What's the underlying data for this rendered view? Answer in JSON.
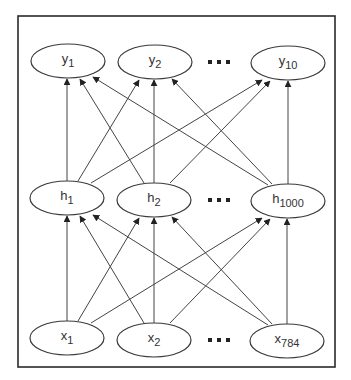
{
  "diagram": {
    "title": "",
    "layers": [
      {
        "name": "output",
        "nodes": [
          {
            "id": "y1",
            "base": "y",
            "sub": "1",
            "cx": 68,
            "cy": 61
          },
          {
            "id": "y2",
            "base": "y",
            "sub": "2",
            "cx": 155,
            "cy": 62
          },
          {
            "id": "y10",
            "base": "y",
            "sub": "10",
            "cx": 288,
            "cy": 63
          }
        ],
        "ellipsis": {
          "text": "• • •",
          "x": 219,
          "y": 62
        }
      },
      {
        "name": "hidden",
        "nodes": [
          {
            "id": "h1",
            "base": "h",
            "sub": "1",
            "cx": 67,
            "cy": 198
          },
          {
            "id": "h2",
            "base": "h",
            "sub": "2",
            "cx": 154,
            "cy": 200
          },
          {
            "id": "h1000",
            "base": "h",
            "sub": "1000",
            "cx": 288,
            "cy": 201
          }
        ],
        "ellipsis": {
          "text": "• • •",
          "x": 219,
          "y": 200
        }
      },
      {
        "name": "input",
        "nodes": [
          {
            "id": "x1",
            "base": "x",
            "sub": "1",
            "cx": 67,
            "cy": 338
          },
          {
            "id": "x2",
            "base": "x",
            "sub": "2",
            "cx": 154,
            "cy": 340
          },
          {
            "id": "x784",
            "base": "x",
            "sub": "784",
            "cx": 287,
            "cy": 341
          }
        ],
        "ellipsis": {
          "text": "• • •",
          "x": 219,
          "y": 340
        }
      }
    ],
    "node_rx": 37,
    "node_ry": 17,
    "edges": [
      {
        "from": "h1",
        "to": "y1",
        "x1": 67,
        "y1": 181,
        "x2": 67,
        "y2": 79
      },
      {
        "from": "h1",
        "to": "y2",
        "x1": 78,
        "y1": 181,
        "x2": 139,
        "y2": 80
      },
      {
        "from": "h1",
        "to": "y10",
        "x1": 91,
        "y1": 183,
        "x2": 262,
        "y2": 80
      },
      {
        "from": "h2",
        "to": "y1",
        "x1": 144,
        "y1": 183,
        "x2": 80,
        "y2": 79
      },
      {
        "from": "h2",
        "to": "y2",
        "x1": 154,
        "y1": 183,
        "x2": 154,
        "y2": 80
      },
      {
        "from": "h2",
        "to": "y10",
        "x1": 170,
        "y1": 183,
        "x2": 270,
        "y2": 81
      },
      {
        "from": "h1000",
        "to": "y1",
        "x1": 268,
        "y1": 185,
        "x2": 93,
        "y2": 77
      },
      {
        "from": "h1000",
        "to": "y2",
        "x1": 272,
        "y1": 184,
        "x2": 172,
        "y2": 79
      },
      {
        "from": "h1000",
        "to": "y10",
        "x1": 288,
        "y1": 184,
        "x2": 288,
        "y2": 81
      },
      {
        "from": "x1",
        "to": "h1",
        "x1": 67,
        "y1": 321,
        "x2": 67,
        "y2": 216
      },
      {
        "from": "x1",
        "to": "h2",
        "x1": 78,
        "y1": 321,
        "x2": 139,
        "y2": 218
      },
      {
        "from": "x1",
        "to": "h1000",
        "x1": 91,
        "y1": 323,
        "x2": 262,
        "y2": 218
      },
      {
        "from": "x2",
        "to": "h1",
        "x1": 144,
        "y1": 323,
        "x2": 80,
        "y2": 216
      },
      {
        "from": "x2",
        "to": "h2",
        "x1": 154,
        "y1": 323,
        "x2": 154,
        "y2": 218
      },
      {
        "from": "x2",
        "to": "h1000",
        "x1": 170,
        "y1": 323,
        "x2": 270,
        "y2": 219
      },
      {
        "from": "x784",
        "to": "h1",
        "x1": 268,
        "y1": 325,
        "x2": 93,
        "y2": 215
      },
      {
        "from": "x784",
        "to": "h2",
        "x1": 272,
        "y1": 324,
        "x2": 172,
        "y2": 217
      },
      {
        "from": "x784",
        "to": "h1000",
        "x1": 287,
        "y1": 324,
        "x2": 287,
        "y2": 219
      }
    ],
    "frame": {
      "x": 18,
      "y": 16,
      "width": 317,
      "height": 351
    },
    "colors": {
      "stroke": "#3a3a3a",
      "text": "#333333",
      "background": "#ffffff"
    }
  }
}
